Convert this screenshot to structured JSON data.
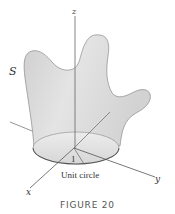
{
  "figure": {
    "caption": "FIGURE 20",
    "surface_label": "S",
    "axes": {
      "x": "x",
      "y": "y",
      "z": "z"
    },
    "radius_label": "1",
    "base_label": "Unit circle"
  },
  "colors": {
    "surface_fill": "#d9d9d9",
    "surface_edge": "#8a8a8a",
    "axis": "#555555",
    "base_fill": "#e6e6e6",
    "text": "#333333",
    "caption": "#555555"
  }
}
